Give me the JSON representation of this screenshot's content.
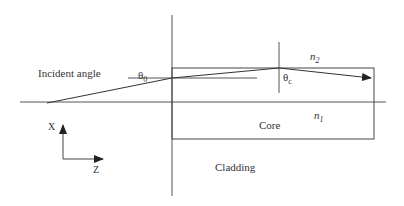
{
  "labels": {
    "incident_angle": "Incident angle",
    "theta0": "θ",
    "theta0_sub": "0",
    "thetac": "θ",
    "thetac_sub": "c",
    "n2": "n",
    "n2_sub": "2",
    "n1": "n",
    "n1_sub": "1",
    "core": "Core",
    "cladding": "Cladding",
    "axis_x": "X",
    "axis_z": "Z"
  },
  "colors": {
    "line": "#333333",
    "text": "#333333"
  }
}
